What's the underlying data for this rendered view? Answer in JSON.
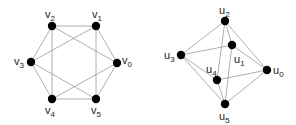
{
  "colors": {
    "edge": "#9a9a9a",
    "node": "#000000",
    "label": "#222222",
    "background": "#ffffff"
  },
  "graphs": [
    {
      "name": "graph-v",
      "nodes": [
        {
          "id": "v0",
          "base": "v",
          "sub": "0",
          "x": 117,
          "y": 63,
          "lx": 122,
          "ly": 64,
          "anchor": "start"
        },
        {
          "id": "v1",
          "base": "v",
          "sub": "1",
          "x": 96,
          "y": 26,
          "lx": 92,
          "ly": 18,
          "anchor": "start"
        },
        {
          "id": "v2",
          "base": "v",
          "sub": "2",
          "x": 52,
          "y": 26,
          "lx": 45,
          "ly": 18,
          "anchor": "start"
        },
        {
          "id": "v3",
          "base": "v",
          "sub": "3",
          "x": 31,
          "y": 62,
          "lx": 14,
          "ly": 65,
          "anchor": "start"
        },
        {
          "id": "v4",
          "base": "v",
          "sub": "4",
          "x": 52,
          "y": 99,
          "lx": 45,
          "ly": 114,
          "anchor": "start"
        },
        {
          "id": "v5",
          "base": "v",
          "sub": "5",
          "x": 96,
          "y": 99,
          "lx": 91,
          "ly": 114,
          "anchor": "start"
        }
      ],
      "edges": [
        [
          "v0",
          "v1"
        ],
        [
          "v1",
          "v2"
        ],
        [
          "v2",
          "v3"
        ],
        [
          "v3",
          "v4"
        ],
        [
          "v4",
          "v5"
        ],
        [
          "v5",
          "v0"
        ],
        [
          "v2",
          "v0"
        ],
        [
          "v1",
          "v3"
        ],
        [
          "v2",
          "v4"
        ],
        [
          "v1",
          "v5"
        ],
        [
          "v3",
          "v5"
        ],
        [
          "v4",
          "v0"
        ]
      ]
    },
    {
      "name": "graph-u",
      "nodes": [
        {
          "id": "u0",
          "base": "u",
          "sub": "0",
          "x": 267,
          "y": 70,
          "lx": 273,
          "ly": 74,
          "anchor": "start"
        },
        {
          "id": "u1",
          "base": "u",
          "sub": "1",
          "x": 232,
          "y": 45,
          "lx": 234,
          "ly": 63,
          "anchor": "start"
        },
        {
          "id": "u2",
          "base": "u",
          "sub": "2",
          "x": 225,
          "y": 21,
          "lx": 219,
          "ly": 14,
          "anchor": "start"
        },
        {
          "id": "u3",
          "base": "u",
          "sub": "3",
          "x": 181,
          "y": 55,
          "lx": 164,
          "ly": 59,
          "anchor": "start"
        },
        {
          "id": "u4",
          "base": "u",
          "sub": "4",
          "x": 217,
          "y": 80,
          "lx": 206,
          "ly": 73,
          "anchor": "start"
        },
        {
          "id": "u5",
          "base": "u",
          "sub": "5",
          "x": 225,
          "y": 104,
          "lx": 219,
          "ly": 120,
          "anchor": "start"
        }
      ],
      "edges": [
        [
          "u2",
          "u3"
        ],
        [
          "u2",
          "u1"
        ],
        [
          "u2",
          "u0"
        ],
        [
          "u2",
          "u4"
        ],
        [
          "u3",
          "u1"
        ],
        [
          "u1",
          "u0"
        ],
        [
          "u1",
          "u5"
        ],
        [
          "u3",
          "u4"
        ],
        [
          "u3",
          "u5"
        ],
        [
          "u4",
          "u0"
        ],
        [
          "u4",
          "u5"
        ],
        [
          "u5",
          "u0"
        ]
      ]
    }
  ]
}
